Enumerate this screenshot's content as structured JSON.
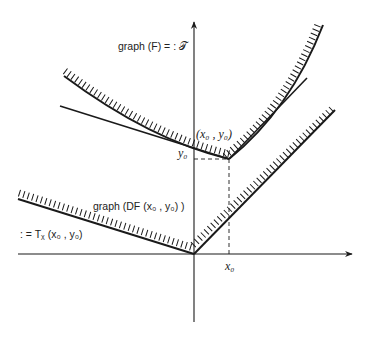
{
  "diagram": {
    "labels": {
      "graph_F": "graph (F) = : 𝒯",
      "point": "(x₀ , y₀)",
      "y0": "y₀",
      "x0": "x₀",
      "graph_DF": "graph (DF (x₀ , y₀) )",
      "tangent_cone": ": = Tᵪ (x₀ , y₀)"
    },
    "colors": {
      "stroke": "#1a1a1a",
      "background": "#ffffff"
    },
    "geometry": {
      "origin": [
        194,
        254
      ],
      "point": [
        229,
        159
      ],
      "x_axis": {
        "from": [
          18,
          254
        ],
        "to": [
          352,
          254
        ]
      },
      "y_axis": {
        "from": [
          194,
          322
        ],
        "to": [
          194,
          22
        ]
      }
    }
  }
}
